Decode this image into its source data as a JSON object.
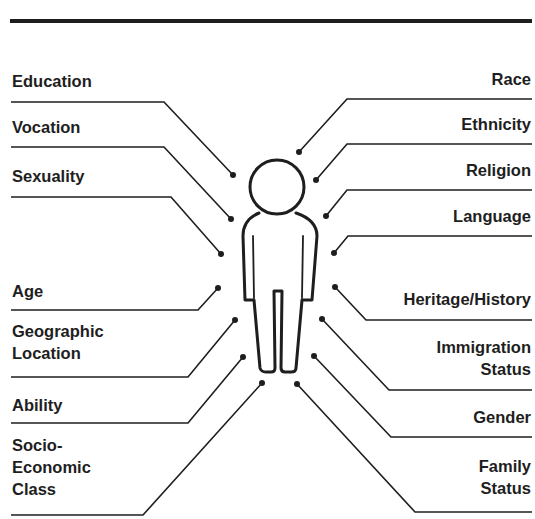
{
  "diagram": {
    "colors": {
      "ink": "#1e1e1e",
      "background": "#ffffff"
    },
    "figure": "person-outline-icon",
    "left_labels": [
      {
        "id": "education",
        "lines": [
          "Education"
        ],
        "text_x": 12,
        "text_y": 70,
        "line_y": 102,
        "elbow_x": 164,
        "dot": [
          233,
          175
        ]
      },
      {
        "id": "vocation",
        "lines": [
          "Vocation"
        ],
        "text_x": 12,
        "text_y": 116,
        "line_y": 147,
        "elbow_x": 164,
        "dot": [
          231,
          219
        ]
      },
      {
        "id": "sexuality",
        "lines": [
          "Sexuality"
        ],
        "text_x": 12,
        "text_y": 165,
        "line_y": 197,
        "elbow_x": 171,
        "dot": [
          221,
          254
        ]
      },
      {
        "id": "age",
        "lines": [
          "Age"
        ],
        "text_x": 12,
        "text_y": 280,
        "line_y": 310,
        "elbow_x": 198,
        "dot": [
          218,
          288
        ]
      },
      {
        "id": "geographic-location",
        "lines": [
          "Geographic",
          "Location"
        ],
        "text_x": 12,
        "text_y": 320,
        "line_y": 377,
        "elbow_x": 188,
        "dot": [
          235,
          320
        ]
      },
      {
        "id": "ability",
        "lines": [
          "Ability"
        ],
        "text_x": 12,
        "text_y": 394,
        "line_y": 423,
        "elbow_x": 188,
        "dot": [
          243,
          357
        ]
      },
      {
        "id": "socio-economic-class",
        "lines": [
          "Socio-",
          "Economic",
          "Class"
        ],
        "text_x": 12,
        "text_y": 434,
        "line_y": 515,
        "elbow_x": 143,
        "dot": [
          262,
          383
        ]
      }
    ],
    "right_labels": [
      {
        "id": "race",
        "lines": [
          "Race"
        ],
        "text_y": 68,
        "line_y": 99,
        "elbow_x": 347,
        "dot": [
          299,
          152
        ]
      },
      {
        "id": "ethnicity",
        "lines": [
          "Ethnicity"
        ],
        "text_y": 113,
        "line_y": 144,
        "elbow_x": 347,
        "dot": [
          316,
          180
        ]
      },
      {
        "id": "religion",
        "lines": [
          "Religion"
        ],
        "text_y": 159,
        "line_y": 190,
        "elbow_x": 347,
        "dot": [
          326,
          216
        ]
      },
      {
        "id": "language",
        "lines": [
          "Language"
        ],
        "text_y": 205,
        "line_y": 236,
        "elbow_x": 348,
        "dot": [
          334,
          253
        ]
      },
      {
        "id": "heritage-history",
        "lines": [
          "Heritage/History"
        ],
        "text_y": 288,
        "line_y": 320,
        "elbow_x": 366,
        "dot": [
          335,
          287
        ]
      },
      {
        "id": "immigration-status",
        "lines": [
          "Immigration",
          "Status"
        ],
        "text_y": 336,
        "line_y": 390,
        "elbow_x": 389,
        "dot": [
          322,
          319
        ]
      },
      {
        "id": "gender",
        "lines": [
          "Gender"
        ],
        "text_y": 406,
        "line_y": 437,
        "elbow_x": 391,
        "dot": [
          314,
          356
        ]
      },
      {
        "id": "family-status",
        "lines": [
          "Family",
          "Status"
        ],
        "text_y": 455,
        "line_y": 512,
        "elbow_x": 415,
        "dot": [
          297,
          384
        ]
      }
    ]
  }
}
